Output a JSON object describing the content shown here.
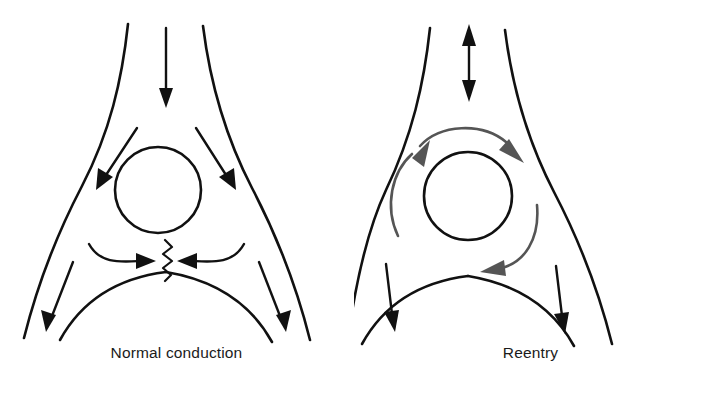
{
  "figure": {
    "type": "diagram",
    "background_color": "#ffffff",
    "panel_count": 2
  },
  "colors": {
    "outline": "#111111",
    "normal_arrow": "#111111",
    "reentry_arrow": "#555555",
    "caption_text": "#1b1b1b",
    "background": "#ffffff"
  },
  "panels": [
    {
      "id": "normal-conduction",
      "caption": "Normal conduction",
      "node_label": "av-node-circle",
      "arrows": [
        {
          "name": "antegrade-input-arrow",
          "direction": "down",
          "style": "straight",
          "color": "#111111",
          "heads": 1
        },
        {
          "name": "left-diagonal-arrow",
          "direction": "down-left",
          "style": "straight",
          "color": "#111111",
          "heads": 1
        },
        {
          "name": "right-diagonal-arrow",
          "direction": "down-right",
          "style": "straight",
          "color": "#111111",
          "heads": 1
        },
        {
          "name": "left-converging-arc-arrow",
          "direction": "right",
          "style": "curved",
          "color": "#111111",
          "heads": 1
        },
        {
          "name": "right-converging-arc-arrow",
          "direction": "left",
          "style": "curved",
          "color": "#111111",
          "heads": 1
        },
        {
          "name": "lower-left-exit-arrow",
          "direction": "down",
          "style": "straight",
          "color": "#111111",
          "heads": 1
        },
        {
          "name": "lower-right-exit-arrow",
          "direction": "down",
          "style": "straight",
          "color": "#111111",
          "heads": 1
        }
      ],
      "symbols": [
        {
          "name": "collision-zigzag-symbol",
          "description": "vertical zigzag marking wavefront collision",
          "color": "#111111"
        }
      ]
    },
    {
      "id": "reentry",
      "caption": "Reentry",
      "node_label": "av-node-circle",
      "arrows": [
        {
          "name": "bidirectional-input-arrow",
          "direction": "up-down",
          "style": "straight",
          "color": "#111111",
          "heads": 2
        },
        {
          "name": "upper-circuit-arc-arrow",
          "direction": "clockwise",
          "style": "curved",
          "color": "#555555",
          "heads": 1
        },
        {
          "name": "right-circuit-arc-arrow",
          "direction": "clockwise",
          "style": "curved",
          "color": "#555555",
          "heads": 1
        },
        {
          "name": "left-circuit-arc-arrow",
          "direction": "clockwise",
          "style": "curved",
          "color": "#555555",
          "heads": 1
        },
        {
          "name": "lower-left-exit-arrow",
          "direction": "down",
          "style": "straight",
          "color": "#111111",
          "heads": 1
        },
        {
          "name": "lower-right-exit-arrow",
          "direction": "down",
          "style": "straight",
          "color": "#111111",
          "heads": 1
        }
      ],
      "symbols": []
    }
  ]
}
